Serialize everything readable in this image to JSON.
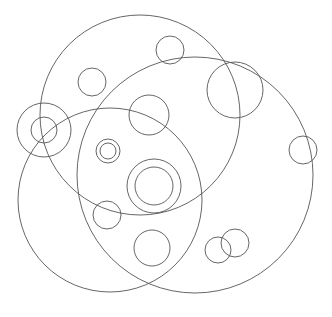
{
  "figure": {
    "background_color": "#ffffff",
    "stroke_color": "#555555",
    "stroke_width": 0.9,
    "width": 332,
    "height": 317
  },
  "chart_data": {
    "type": "scatter",
    "subtitle": "",
    "xlabel": "",
    "ylabel": "",
    "xlim": [
      0,
      332
    ],
    "ylim": [
      0,
      317
    ],
    "grid": false,
    "legend": "none",
    "marker": "open-circle",
    "units": "pixels",
    "note": "Each data point is an outlined circle: cx, cy = center in pixel coordinates (origin top-left), r = radius in pixels. No fill, uniform thin gray stroke.",
    "fields": [
      "id",
      "cx",
      "cy",
      "r",
      "group"
    ],
    "circles": [
      {
        "id": "large-top-left",
        "cx": 140,
        "cy": 115,
        "r": 100,
        "group": "large"
      },
      {
        "id": "large-bottom-left",
        "cx": 110,
        "cy": 200,
        "r": 92,
        "group": "large"
      },
      {
        "id": "large-right",
        "cx": 195,
        "cy": 175,
        "r": 118,
        "group": "large"
      },
      {
        "id": "concentric-left-outer",
        "cx": 44,
        "cy": 130,
        "r": 27,
        "group": "concentric-left"
      },
      {
        "id": "concentric-left-inner",
        "cx": 44,
        "cy": 130,
        "r": 13,
        "group": "concentric-left"
      },
      {
        "id": "concentric-center-outer",
        "cx": 154,
        "cy": 186,
        "r": 27,
        "group": "concentric-center"
      },
      {
        "id": "concentric-center-inner",
        "cx": 154,
        "cy": 186,
        "r": 19,
        "group": "concentric-center"
      },
      {
        "id": "concentric-small-outer",
        "cx": 108,
        "cy": 151,
        "r": 12,
        "group": "concentric-small"
      },
      {
        "id": "concentric-small-inner",
        "cx": 108,
        "cy": 151,
        "r": 8,
        "group": "concentric-small"
      },
      {
        "id": "medium-upper-right",
        "cx": 235,
        "cy": 90,
        "r": 28,
        "group": "medium"
      },
      {
        "id": "medium-upper-mid",
        "cx": 149,
        "cy": 115,
        "r": 20,
        "group": "medium"
      },
      {
        "id": "medium-bottom-mid",
        "cx": 152,
        "cy": 248,
        "r": 18,
        "group": "medium"
      },
      {
        "id": "small-top",
        "cx": 170,
        "cy": 50,
        "r": 14,
        "group": "small"
      },
      {
        "id": "small-top-left",
        "cx": 92,
        "cy": 82,
        "r": 14,
        "group": "small"
      },
      {
        "id": "small-right-edge",
        "cx": 303,
        "cy": 150,
        "r": 14,
        "group": "small"
      },
      {
        "id": "small-mid-left",
        "cx": 107,
        "cy": 215,
        "r": 14,
        "group": "small"
      },
      {
        "id": "small-pair-left",
        "cx": 218,
        "cy": 250,
        "r": 13,
        "group": "small-pair"
      },
      {
        "id": "small-pair-right",
        "cx": 235,
        "cy": 243,
        "r": 14,
        "group": "small-pair"
      }
    ],
    "counts": {
      "total": 18,
      "large": 3,
      "concentric_pairs": 3,
      "medium": 3,
      "small": 6
    }
  }
}
